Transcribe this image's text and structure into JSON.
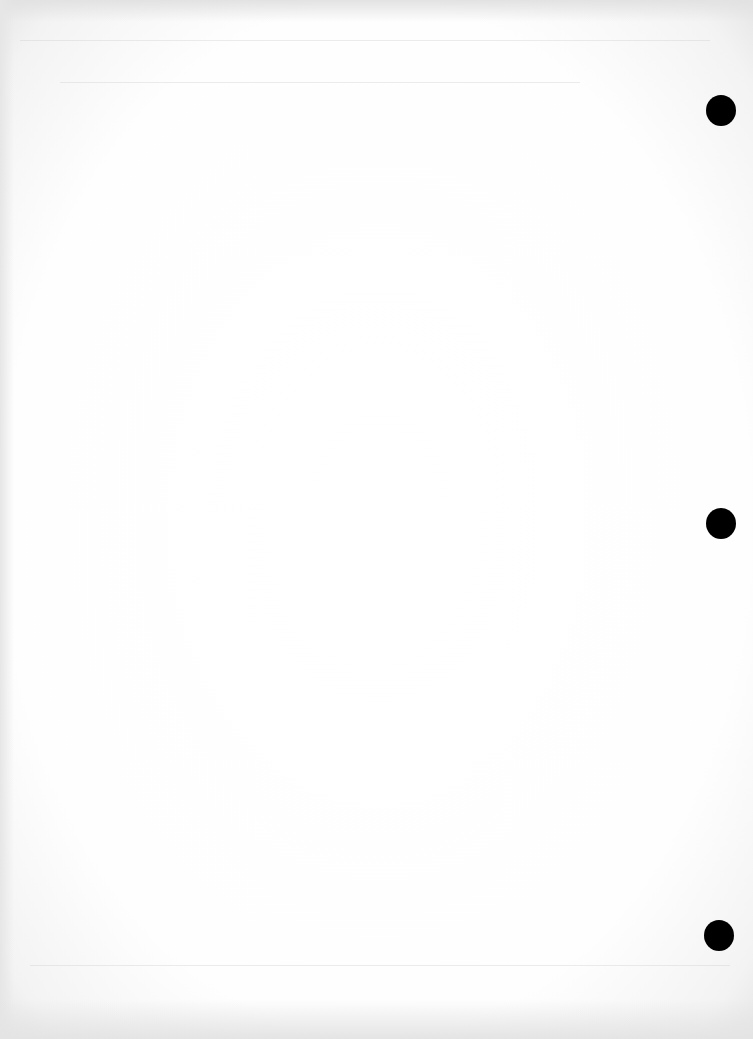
{
  "document": {
    "type": "scanned blank page",
    "page_color": "#ffffff",
    "border_color": "#e6e6e6",
    "text": ""
  },
  "punch_holes": [
    {
      "name": "top",
      "x": 706,
      "y": 95
    },
    {
      "name": "middle",
      "x": 706,
      "y": 508
    },
    {
      "name": "bottom",
      "x": 704,
      "y": 920
    }
  ]
}
